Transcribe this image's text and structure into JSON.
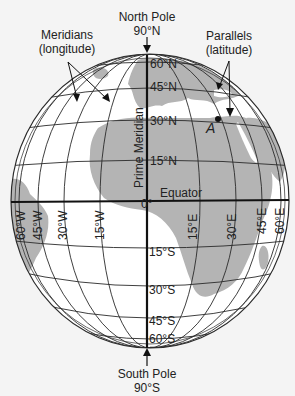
{
  "title_labels": {
    "north_pole": "North Pole",
    "north_pole_lat": "90°N",
    "south_pole": "South Pole",
    "south_pole_lat": "90°S",
    "meridians": "Meridians",
    "meridians_sub": "(longitude)",
    "parallels": "Parallels",
    "parallels_sub": "(latitude)",
    "prime_meridian": "Prime Meridian",
    "equator": "Equator",
    "point_a": "A",
    "zero": "0°"
  },
  "latitudes": [
    {
      "label": "60°N",
      "y": 62
    },
    {
      "label": "45°N",
      "y": 86
    },
    {
      "label": "30°N",
      "y": 121
    },
    {
      "label": "15°N",
      "y": 161
    },
    {
      "label": "15°S",
      "y": 250
    },
    {
      "label": "30°S",
      "y": 288
    },
    {
      "label": "45°S",
      "y": 320
    },
    {
      "label": "60°S",
      "y": 338
    }
  ],
  "longitudes": [
    {
      "label": "60°W",
      "x": 17
    },
    {
      "label": "45°W",
      "x": 40
    },
    {
      "label": "30°W",
      "x": 65
    },
    {
      "label": "15°W",
      "x": 100
    },
    {
      "label": "15°E",
      "x": 192
    },
    {
      "label": "30°E",
      "x": 232
    },
    {
      "label": "45°E",
      "x": 262
    },
    {
      "label": "60°E",
      "x": 282
    }
  ],
  "colors": {
    "ocean": "#ffffff",
    "land": "#b4b4b4",
    "lines": "#2a2a2a",
    "background": "#f4f4f4"
  }
}
